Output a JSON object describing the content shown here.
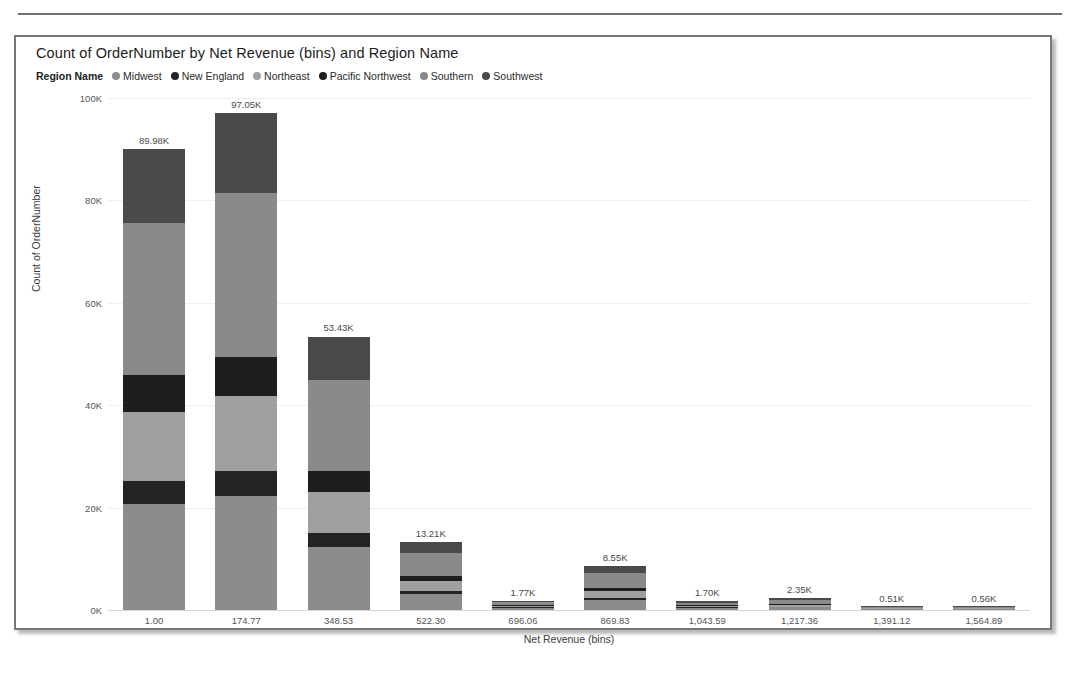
{
  "chart_data": {
    "type": "bar",
    "subtype": "stacked-column",
    "title": "Count of OrderNumber by Net Revenue (bins) and Region Name",
    "xlabel": "Net Revenue (bins)",
    "ylabel": "Count of OrderNumber",
    "legend_title": "Region Name",
    "legend_position": "top-left",
    "grid": true,
    "ylim": [
      0,
      100000
    ],
    "yticks": [
      "0K",
      "20K",
      "40K",
      "60K",
      "80K",
      "100K"
    ],
    "ytick_values": [
      0,
      20000,
      40000,
      60000,
      80000,
      100000
    ],
    "categories": [
      "1.00",
      "174.77",
      "348.53",
      "522.30",
      "696.06",
      "869.83",
      "1,043.59",
      "1,217.36",
      "1,391.12",
      "1,564.89"
    ],
    "totals": [
      89980,
      97050,
      53430,
      13210,
      1770,
      8550,
      1700,
      2350,
      510,
      560
    ],
    "total_labels": [
      "89.98K",
      "97.05K",
      "53.43K",
      "13.21K",
      "1.77K",
      "8.55K",
      "1.70K",
      "2.35K",
      "0.51K",
      "0.56K"
    ],
    "series": [
      {
        "name": "Midwest",
        "color": "#8c8c8c",
        "values": [
          20700,
          22300,
          12300,
          3040,
          410,
          1970,
          390,
          540,
          120,
          130
        ]
      },
      {
        "name": "New England",
        "color": "#232323",
        "values": [
          4500,
          4850,
          2670,
          660,
          90,
          430,
          85,
          118,
          26,
          28
        ]
      },
      {
        "name": "Northeast",
        "color": "#a0a0a0",
        "values": [
          13500,
          14560,
          8010,
          1980,
          265,
          1280,
          255,
          352,
          76,
          84
        ]
      },
      {
        "name": "Pacific Northwest",
        "color": "#1e1e1e",
        "values": [
          7200,
          7760,
          4270,
          1060,
          142,
          684,
          136,
          188,
          41,
          45
        ]
      },
      {
        "name": "Southern",
        "color": "#8a8a8a",
        "values": [
          29700,
          32030,
          17630,
          4360,
          583,
          2820,
          561,
          776,
          168,
          185
        ]
      },
      {
        "name": "Southwest",
        "color": "#4a4a4a",
        "values": [
          14380,
          15550,
          8550,
          2110,
          280,
          1366,
          273,
          376,
          79,
          88
        ]
      }
    ]
  }
}
